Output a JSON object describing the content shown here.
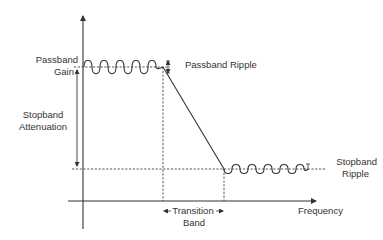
{
  "diagram": {
    "labels": {
      "passband_gain_line1": "Passband",
      "passband_gain_line2": "Gain",
      "passband_ripple": "Passband Ripple",
      "stopband_attenuation_line1": "Stopband",
      "stopband_attenuation_line2": "Attenuation",
      "stopband_ripple_line1": "Stopband",
      "stopband_ripple_line2": "Ripple",
      "transition_band_line1": "Transition",
      "transition_band_line2": "Band",
      "x_axis": "Frequency"
    },
    "colors": {
      "line": "#333333",
      "background": "#ffffff"
    },
    "geometry": {
      "y_axis_x": 83,
      "x_axis_y": 201,
      "passband_level_y": 67,
      "stopband_level_y": 169,
      "passband_edge_x": 163,
      "stopband_edge_x": 224,
      "passband_ripple_cycles": 5,
      "stopband_ripple_cycles": 5
    }
  }
}
